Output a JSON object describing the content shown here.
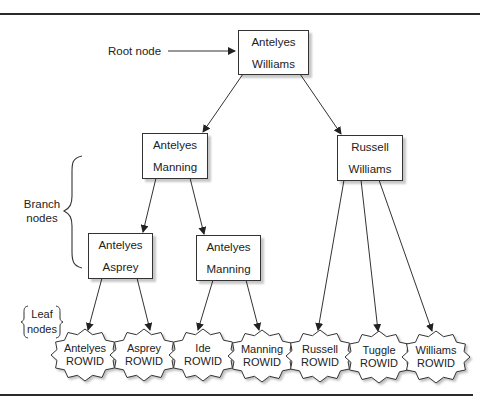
{
  "diagram": {
    "type": "b-tree-index",
    "annotations": {
      "root": "Root node",
      "branch_line1": "Branch",
      "branch_line2": "nodes",
      "leaf_line1": "Leaf",
      "leaf_line2": "nodes"
    },
    "root": {
      "line1": "Antelyes",
      "line2": "Williams"
    },
    "branches": [
      {
        "line1": "Antelyes",
        "line2": "Manning"
      },
      {
        "line1": "Russell",
        "line2": "Williams"
      },
      {
        "line1": "Antelyes",
        "line2": "Asprey"
      },
      {
        "line1": "Antelyes",
        "line2": "Manning"
      }
    ],
    "leaves": [
      {
        "line1": "Antelyes",
        "line2": "ROWID"
      },
      {
        "line1": "Asprey",
        "line2": "ROWID"
      },
      {
        "line1": "Ide",
        "line2": "ROWID"
      },
      {
        "line1": "Manning",
        "line2": "ROWID"
      },
      {
        "line1": "Russell",
        "line2": "ROWID"
      },
      {
        "line1": "Tuggle",
        "line2": "ROWID"
      },
      {
        "line1": "Williams",
        "line2": "ROWID"
      }
    ],
    "edges": [
      [
        "root",
        "branch-0"
      ],
      [
        "root",
        "branch-1"
      ],
      [
        "branch-0",
        "branch-2"
      ],
      [
        "branch-0",
        "branch-3"
      ],
      [
        "branch-2",
        "leaf-0"
      ],
      [
        "branch-2",
        "leaf-1"
      ],
      [
        "branch-3",
        "leaf-2"
      ],
      [
        "branch-3",
        "leaf-3"
      ],
      [
        "branch-1",
        "leaf-4"
      ],
      [
        "branch-1",
        "leaf-5"
      ],
      [
        "branch-1",
        "leaf-6"
      ]
    ]
  },
  "colors": {
    "stroke": "#333333",
    "rule": "#2a2a2a",
    "background": "#ffffff"
  }
}
